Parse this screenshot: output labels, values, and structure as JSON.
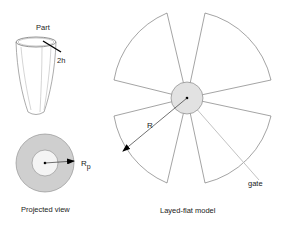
{
  "labels": {
    "part": "Part",
    "thickness": "2h",
    "radius_projected": "R",
    "radius_projected_sub": "p",
    "radius_flat": "R",
    "gate": "gate",
    "caption_left": "Projected view",
    "caption_right": "Layed-flat model"
  },
  "colors": {
    "stroke": "#555555",
    "ring_fill": "#cfcfcf",
    "hub_fill": "#e2e2e2",
    "gate_line": "#bbbbbb",
    "arrow": "#000000"
  }
}
